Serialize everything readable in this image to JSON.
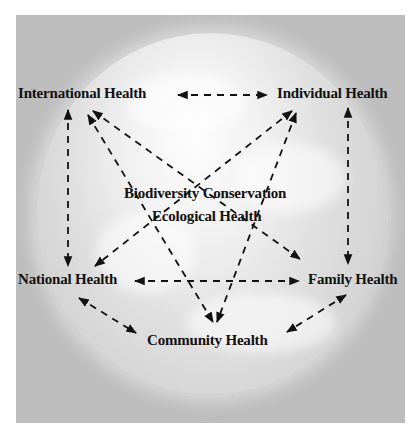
{
  "diagram": {
    "nodes": {
      "international": "International Health",
      "individual": "Individual Health",
      "national": "National Health",
      "family": "Family Health",
      "community": "Community Health",
      "center_line1": "Biodiversity Conservation",
      "center_line2": "Ecological Health"
    },
    "edges": [
      {
        "from": "International Health",
        "to": "Individual Health",
        "type": "bidirectional-dashed"
      },
      {
        "from": "International Health",
        "to": "National Health",
        "type": "bidirectional-dashed"
      },
      {
        "from": "Individual Health",
        "to": "Family Health",
        "type": "bidirectional-dashed"
      },
      {
        "from": "National Health",
        "to": "Family Health",
        "type": "bidirectional-dashed"
      },
      {
        "from": "National Health",
        "to": "Community Health",
        "type": "bidirectional-dashed"
      },
      {
        "from": "Family Health",
        "to": "Community Health",
        "type": "bidirectional-dashed"
      },
      {
        "from": "International Health",
        "to": "Family Health",
        "type": "bidirectional-dashed"
      },
      {
        "from": "International Health",
        "to": "Community Health",
        "type": "bidirectional-dashed"
      },
      {
        "from": "Individual Health",
        "to": "National Health",
        "type": "bidirectional-dashed"
      },
      {
        "from": "Individual Health",
        "to": "Community Health",
        "type": "bidirectional-dashed"
      }
    ],
    "background": "earth-globe-image",
    "colors": {
      "panel": "#bdbdbd",
      "text": "#111111",
      "arrows": "#111111"
    }
  }
}
